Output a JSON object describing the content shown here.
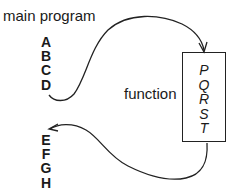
{
  "diagram": {
    "title": "main program",
    "main_program_before": [
      "A",
      "B",
      "C",
      "D"
    ],
    "main_program_after": [
      "E",
      "F",
      "G",
      "H"
    ],
    "function_label": "function",
    "function_body": [
      "P",
      "Q",
      "R",
      "S",
      "T"
    ],
    "arrows": [
      {
        "from": "D",
        "to": "function-box",
        "description": "call"
      },
      {
        "from": "function-box",
        "to": "E",
        "description": "return"
      }
    ]
  }
}
